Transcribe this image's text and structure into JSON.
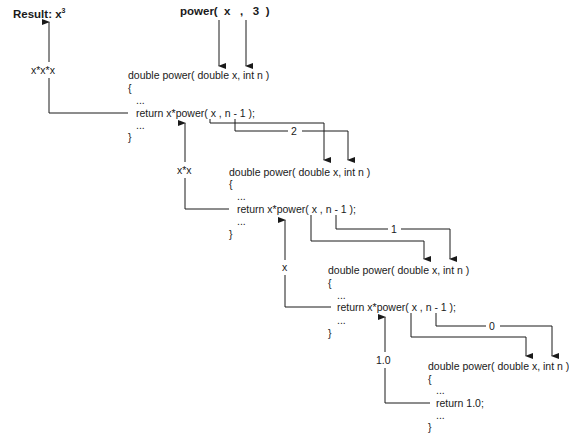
{
  "result": {
    "label": "Result: x",
    "superscript": "3"
  },
  "call": {
    "text": "power(  x   ,   3  )"
  },
  "blocks": [
    {
      "signature": "double power( double x, int n )",
      "open": "{",
      "dots1": "...",
      "return": "return x*power( x , n - 1 );",
      "dots2": "...",
      "close": "}"
    },
    {
      "signature": "double power( double x, int n )",
      "open": "{",
      "dots1": "...",
      "return": "return x*power( x , n - 1 );",
      "dots2": "...",
      "close": "}"
    },
    {
      "signature": "double power( double x, int n )",
      "open": "{",
      "dots1": "...",
      "return": "return x*power( x , n - 1 );",
      "dots2": "...",
      "close": "}"
    },
    {
      "signature": "double power( double x, int n )",
      "open": "{",
      "dots1": "...",
      "return": "return 1.0;",
      "dots2": "...",
      "close": "}"
    }
  ],
  "return_values": [
    "x*x*x",
    "x*x",
    "x",
    "1.0"
  ],
  "n_values": [
    "2",
    "1",
    "0"
  ]
}
